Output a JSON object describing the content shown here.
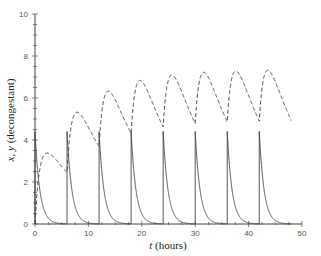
{
  "chart_data": {
    "type": "line",
    "title": "",
    "xlabel_italic": "t",
    "xlabel_rest": " (hours)",
    "ylabel_italic": "x, y",
    "ylabel_rest": " (decongestant)",
    "xlim": [
      0,
      50
    ],
    "ylim": [
      0,
      10
    ],
    "x_ticks": [
      0,
      10,
      20,
      30,
      40,
      50
    ],
    "y_ticks": [
      0,
      2,
      4,
      6,
      8,
      10
    ],
    "grid": false,
    "legend": null,
    "dose_interval_hours": 6,
    "dose_times": [
      0,
      6,
      12,
      18,
      24,
      30,
      36,
      42
    ],
    "series": [
      {
        "name": "x (GI tract)",
        "style": "solid",
        "description": "Spikes to ~4.4 at each dose then decays exponentially toward 0",
        "peaks": [
          4.4,
          4.4,
          4.4,
          4.4,
          4.4,
          4.4,
          4.4,
          4.4
        ],
        "x": [
          0,
          0.5,
          1,
          2,
          3,
          4,
          6,
          6.5,
          7,
          8,
          12,
          18,
          24,
          30,
          36,
          42,
          48
        ],
        "values": [
          4.4,
          2.6,
          1.5,
          0.5,
          0.17,
          0.06,
          0.0,
          2.6,
          1.5,
          0.5,
          4.4,
          4.4,
          4.4,
          4.4,
          4.4,
          4.4,
          0.01
        ]
      },
      {
        "name": "y (bloodstream)",
        "style": "dashed",
        "description": "Rises and oscillates with increasing peaks approaching steady state",
        "x": [
          0,
          2,
          6,
          7.5,
          12,
          13.5,
          18,
          19.5,
          24,
          25.5,
          30,
          31.5,
          36,
          37.5,
          42,
          43.5,
          48
        ],
        "values": [
          0,
          4.6,
          3.0,
          6.9,
          4.4,
          8.0,
          5.0,
          8.4,
          5.3,
          8.7,
          5.5,
          8.8,
          5.6,
          8.8,
          5.6,
          8.9,
          5.6
        ]
      }
    ]
  }
}
